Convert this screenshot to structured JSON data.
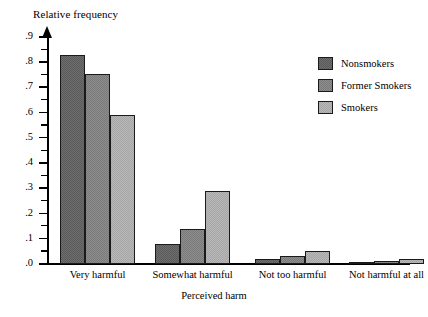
{
  "chart_data": {
    "type": "bar",
    "title": "",
    "ylabel": "Relative frequency",
    "xlabel": "Perceived harm",
    "categories": [
      "Very harmful",
      "Somewhat harmful",
      "Not too harmful",
      "Not harmful at all"
    ],
    "series": [
      {
        "name": "Nonsmokers",
        "values": [
          0.83,
          0.08,
          0.02,
          0.005
        ]
      },
      {
        "name": "Former Smokers",
        "values": [
          0.755,
          0.14,
          0.03,
          0.01
        ]
      },
      {
        "name": "Smokers",
        "values": [
          0.59,
          0.29,
          0.05,
          0.02
        ]
      }
    ],
    "ylim": [
      0,
      0.9
    ],
    "ytick_labels": [
      ".0",
      ".1",
      ".2",
      ".3",
      ".4",
      ".5",
      ".6",
      ".7",
      ".8",
      ".9"
    ],
    "ytick_values": [
      0.0,
      0.1,
      0.2,
      0.3,
      0.4,
      0.5,
      0.6,
      0.7,
      0.8,
      0.9
    ],
    "minor_ticks": true,
    "grid": false,
    "legend_position": "top-right",
    "colors": {
      "nonsmokers": "#6e6e6e",
      "former_smokers": "#8d8d8d",
      "smokers": "#b8b8b8",
      "axis": "#000000",
      "background": "#ffffff"
    }
  },
  "legend": {
    "items": [
      {
        "label": "Nonsmokers",
        "key": "nonsmokers"
      },
      {
        "label": "Former Smokers",
        "key": "former_smokers"
      },
      {
        "label": "Smokers",
        "key": "smokers"
      }
    ]
  }
}
